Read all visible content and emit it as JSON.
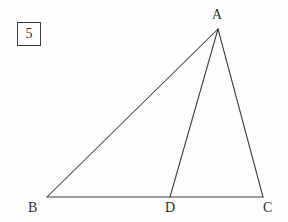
{
  "figure": {
    "problem_number": "5",
    "canvas": {
      "width": 288,
      "height": 222
    },
    "background_color": "#fefefe",
    "stroke_color": "#3a3a3a",
    "label_color": "#2e2e2e",
    "points": {
      "A": {
        "label": "A",
        "x": 218,
        "y": 29
      },
      "B": {
        "label": "B",
        "x": 47,
        "y": 197
      },
      "C": {
        "label": "C",
        "x": 263,
        "y": 197
      },
      "D": {
        "label": "D",
        "x": 170,
        "y": 197
      }
    },
    "segments": [
      {
        "name": "AB",
        "from": "A",
        "to": "B"
      },
      {
        "name": "BC",
        "from": "B",
        "to": "C"
      },
      {
        "name": "CA",
        "from": "C",
        "to": "A"
      },
      {
        "name": "AD",
        "from": "A",
        "to": "D"
      }
    ]
  }
}
